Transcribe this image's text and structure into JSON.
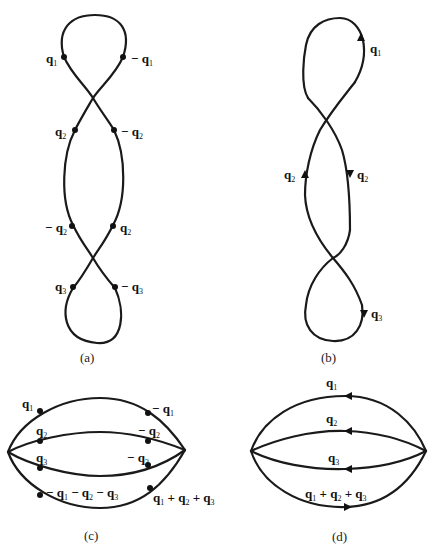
{
  "figure": {
    "panels": [
      {
        "id": "a",
        "caption": "(a)",
        "labels": [
          "q1",
          "-q1",
          "q2",
          "-q2",
          "-q2",
          "q2",
          "q3",
          "-q3"
        ]
      },
      {
        "id": "b",
        "caption": "(b)",
        "labels": [
          "q1",
          "q2",
          "q2",
          "q3"
        ]
      },
      {
        "id": "c",
        "caption": "(c)",
        "labels": [
          "q1",
          "-q1",
          "q2",
          "-q2",
          "q3",
          "-q3",
          "-q1 - q2 - q3",
          "q1 + q2 + q3"
        ]
      },
      {
        "id": "d",
        "caption": "(d)",
        "labels": [
          "q1",
          "q2",
          "q3",
          "q1 + q2 + q3"
        ]
      }
    ]
  },
  "captions": {
    "a": "(a)",
    "b": "(b)",
    "c": "(c)",
    "d": "(d)"
  },
  "colors": {
    "line": "#1a1a1a",
    "background": "#ffffff"
  }
}
